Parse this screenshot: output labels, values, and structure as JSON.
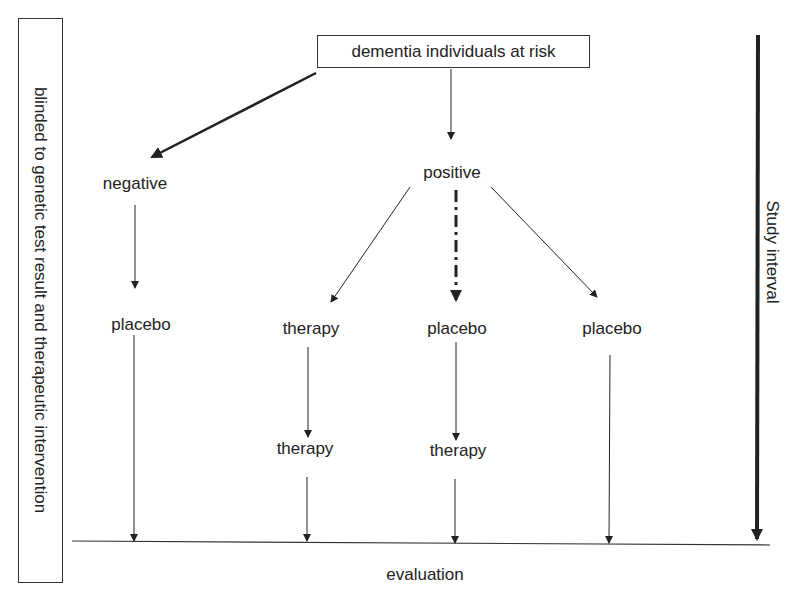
{
  "diagram": {
    "top_box": "dementia individuals at risk",
    "side_box": "blinded to genetic test result and therapeutic intervention",
    "study_interval": "Study interval",
    "evaluation": "evaluation",
    "negative": "negative",
    "positive": "positive",
    "branches": [
      {
        "level1": "placebo",
        "level2": ""
      },
      {
        "level1": "therapy",
        "level2": "therapy"
      },
      {
        "level1": "placebo",
        "level2": "therapy"
      },
      {
        "level1": "placebo",
        "level2": ""
      }
    ]
  }
}
